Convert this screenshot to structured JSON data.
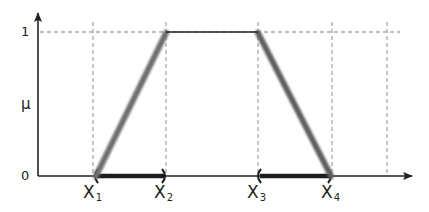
{
  "diagram": {
    "y_axis": {
      "label": "μ",
      "ticks": [
        {
          "label": "1",
          "y": 32
        },
        {
          "label": "0",
          "y": 176
        }
      ]
    },
    "x_axis": {
      "points": [
        {
          "name": "X",
          "sub": "1",
          "x": 95
        },
        {
          "name": "X",
          "sub": "2",
          "x": 165
        },
        {
          "name": "X",
          "sub": "3",
          "x": 258
        },
        {
          "name": "X",
          "sub": "4",
          "x": 332
        }
      ],
      "extra_gridline_x": 387
    },
    "shape": {
      "type": "trapezoid",
      "vertices": [
        [
          95,
          176
        ],
        [
          166,
          32
        ],
        [
          258,
          32
        ],
        [
          332,
          176
        ]
      ],
      "slope_color": "#6e6e6e",
      "top_color": "#222222"
    },
    "intervals": [
      {
        "from": 95,
        "to": 165,
        "label": "rising support"
      },
      {
        "from": 258,
        "to": 332,
        "label": "falling support"
      }
    ],
    "colors": {
      "axis": "#222222",
      "grid": "#a9a9a9",
      "bar": "#1c1c1c"
    }
  }
}
